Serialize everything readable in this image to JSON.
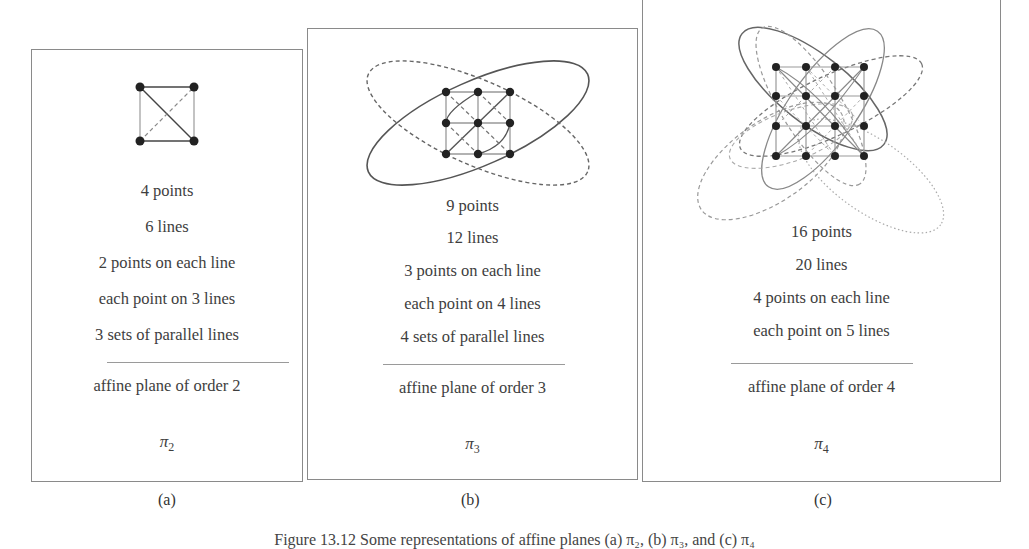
{
  "figure": {
    "caption": "Figure 13.12  Some representations of affine planes (a) π₂, (b) π₃, and (c) π₄",
    "panels": [
      {
        "label": "(a)",
        "lines": [
          "4 points",
          "6 lines",
          "2 points on each line",
          "each point on 3 lines",
          "3 sets of parallel lines"
        ],
        "name": "affine plane of order 2",
        "symbol": "π",
        "subscript": "2",
        "order": 2,
        "points": 4,
        "num_lines": 6
      },
      {
        "label": "(b)",
        "lines": [
          "9 points",
          "12 lines",
          "3 points on each line",
          "each point on 4 lines",
          "4 sets of parallel lines"
        ],
        "name": "affine plane of order 3",
        "symbol": "π",
        "subscript": "3",
        "order": 3,
        "points": 9,
        "num_lines": 12
      },
      {
        "label": "(c)",
        "lines": [
          "16 points",
          "20 lines",
          "4 points on each line",
          "each point on 5 lines"
        ],
        "name": "affine plane of order 4",
        "symbol": "π",
        "subscript": "4",
        "order": 4,
        "points": 16,
        "num_lines": 20
      }
    ]
  },
  "colors": {
    "point": "#222222",
    "line_dark": "#555555",
    "line_light": "#aaaaaa",
    "border": "#8a8a8a",
    "text": "#3e3e3e"
  }
}
